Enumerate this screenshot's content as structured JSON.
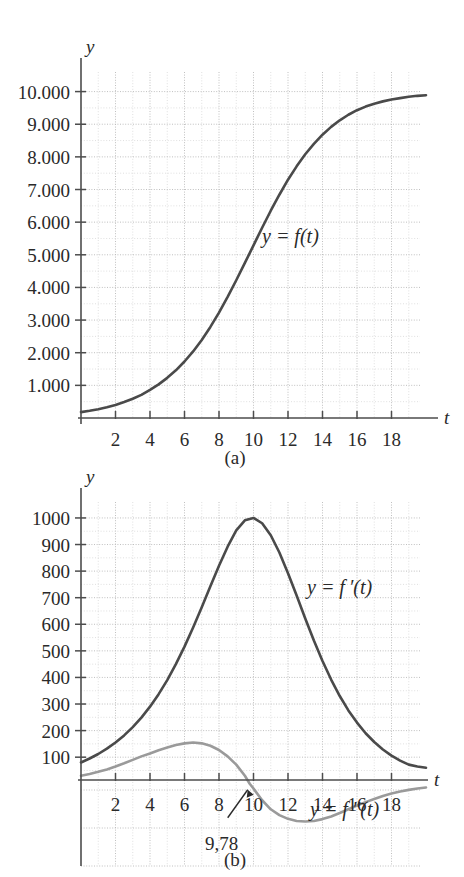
{
  "figure": {
    "caption_a": "(a)",
    "caption_b": "(b)"
  },
  "chart_data": [
    {
      "id": "chart-a",
      "type": "line",
      "title": "",
      "xlabel": "t",
      "ylabel": "y",
      "xlim": [
        0,
        20
      ],
      "ylim": [
        0,
        10600
      ],
      "grid": true,
      "xticks": [
        2,
        4,
        6,
        8,
        10,
        12,
        14,
        16,
        18
      ],
      "xtick_labels": [
        "2",
        "4",
        "6",
        "8",
        "10",
        "12",
        "14",
        "16",
        "18"
      ],
      "yticks": [
        1000,
        2000,
        3000,
        4000,
        5000,
        6000,
        7000,
        8000,
        9000,
        10000
      ],
      "ytick_labels": [
        "1.000",
        "2.000",
        "3.000",
        "4.000",
        "5.000",
        "6.000",
        "7.000",
        "8.000",
        "9.000",
        "10.000"
      ],
      "series": [
        {
          "name": "y = f(t)",
          "label": "y = f(t)",
          "color": "#4a4a4a",
          "style": "solid",
          "x": [
            0,
            0.5,
            1,
            1.5,
            2,
            2.5,
            3,
            3.5,
            4,
            4.5,
            5,
            5.5,
            6,
            6.5,
            7,
            7.5,
            8,
            8.5,
            9,
            9.5,
            10,
            10.5,
            11,
            11.5,
            12,
            12.5,
            13,
            13.5,
            14,
            14.5,
            15,
            15.5,
            16,
            16.5,
            17,
            17.5,
            18,
            18.5,
            19,
            19.5,
            20
          ],
          "y": [
            180,
            220,
            270,
            330,
            400,
            490,
            590,
            710,
            860,
            1030,
            1230,
            1460,
            1730,
            2040,
            2390,
            2790,
            3230,
            3710,
            4220,
            4750,
            5290,
            5830,
            6350,
            6840,
            7300,
            7710,
            8080,
            8400,
            8680,
            8920,
            9120,
            9290,
            9430,
            9540,
            9630,
            9700,
            9760,
            9800,
            9840,
            9870,
            9890
          ]
        }
      ]
    },
    {
      "id": "chart-b",
      "type": "line",
      "title": "",
      "xlabel": "t",
      "ylabel": "y",
      "xlim": [
        0,
        20
      ],
      "ylim": [
        -110,
        1060
      ],
      "grid": true,
      "xticks": [
        2,
        4,
        6,
        8,
        10,
        12,
        14,
        16,
        18
      ],
      "xtick_labels": [
        "2",
        "4",
        "6",
        "8",
        "10",
        "12",
        "14",
        "16",
        "18"
      ],
      "yticks": [
        100,
        200,
        300,
        400,
        500,
        600,
        700,
        800,
        900,
        1000
      ],
      "ytick_labels": [
        "100",
        "200",
        "300",
        "400",
        "500",
        "600",
        "700",
        "800",
        "900",
        "1000"
      ],
      "annotations": [
        {
          "name": "inflection-point",
          "text": "9,78",
          "x": 9.78,
          "y": 0
        }
      ],
      "series": [
        {
          "name": "y = f'(t)",
          "label": "y = f ′(t)",
          "color": "#4a4a4a",
          "style": "solid",
          "x": [
            0,
            0.5,
            1,
            1.5,
            2,
            2.5,
            3,
            3.5,
            4,
            4.5,
            5,
            5.5,
            6,
            6.5,
            7,
            7.5,
            8,
            8.5,
            9,
            9.5,
            10,
            10.5,
            11,
            11.5,
            12,
            12.5,
            13,
            13.5,
            14,
            14.5,
            15,
            15.5,
            16,
            16.5,
            17,
            17.5,
            18,
            18.5,
            19,
            19.5,
            20
          ],
          "y": [
            80,
            95,
            112,
            132,
            155,
            182,
            213,
            249,
            290,
            337,
            390,
            450,
            516,
            588,
            664,
            743,
            820,
            892,
            953,
            991,
            1000,
            980,
            935,
            870,
            792,
            708,
            622,
            539,
            462,
            392,
            330,
            276,
            230,
            190,
            157,
            129,
            106,
            87,
            72,
            65,
            60
          ]
        },
        {
          "name": "y = f''(t)",
          "label": "y = f ″(t)",
          "color": "#9a9a9a",
          "style": "solid",
          "x": [
            0,
            0.5,
            1,
            1.5,
            2,
            2.5,
            3,
            3.5,
            4,
            4.5,
            5,
            5.5,
            6,
            6.5,
            7,
            7.5,
            8,
            8.5,
            9,
            9.5,
            9.78,
            10,
            10.5,
            11,
            11.5,
            12,
            12.5,
            13,
            13.5,
            14,
            14.5,
            15,
            15.5,
            16,
            16.5,
            17,
            17.5,
            18,
            18.5,
            19,
            19.5,
            20
          ],
          "y": [
            30,
            37,
            45,
            54,
            65,
            77,
            90,
            103,
            114,
            126,
            136,
            146,
            152,
            155,
            152,
            143,
            127,
            103,
            72,
            30,
            0,
            -18,
            -62,
            -96,
            -118,
            -132,
            -140,
            -142,
            -140,
            -133,
            -123,
            -110,
            -96,
            -82,
            -69,
            -57,
            -46,
            -37,
            -29,
            -23,
            -18,
            -14
          ]
        }
      ]
    }
  ]
}
